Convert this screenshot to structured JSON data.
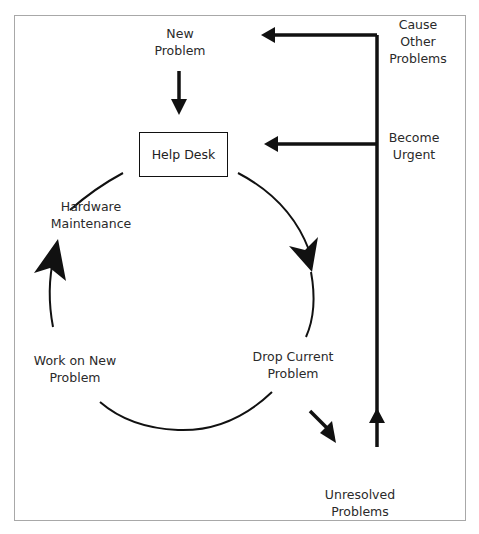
{
  "diagram": {
    "nodes": {
      "new_problem": {
        "line1": "New",
        "line2": "Problem"
      },
      "help_desk": {
        "label": "Help Desk"
      },
      "hardware_maintenance": {
        "line1": "Hardware",
        "line2": "Maintenance"
      },
      "work_on_new_problem": {
        "line1": "Work on New",
        "line2": "Problem"
      },
      "drop_current_problem": {
        "line1": "Drop Current",
        "line2": "Problem"
      },
      "unresolved_problems": {
        "line1": "Unresolved",
        "line2": "Problems"
      },
      "cause_other_problems": {
        "line1": "Cause",
        "line2": "Other",
        "line3": "Problems"
      },
      "become_urgent": {
        "line1": "Become",
        "line2": "Urgent"
      }
    },
    "edges": [
      {
        "from": "New Problem",
        "to": "Help Desk"
      },
      {
        "from": "Help Desk",
        "to": "Drop Current Problem"
      },
      {
        "from": "Drop Current Problem",
        "to": "Work on New Problem"
      },
      {
        "from": "Work on New Problem",
        "to": "Hardware Maintenance"
      },
      {
        "from": "Drop Current Problem",
        "to": "Unresolved Problems"
      },
      {
        "from": "Unresolved Problems",
        "to": "Cause Other Problems"
      },
      {
        "from": "Cause Other Problems",
        "to": "New Problem"
      },
      {
        "from": "Become Urgent",
        "to": "Help Desk"
      }
    ],
    "colors": {
      "line": "#111111",
      "frame": "#a8a8a8",
      "text": "#2a2a2a"
    }
  }
}
